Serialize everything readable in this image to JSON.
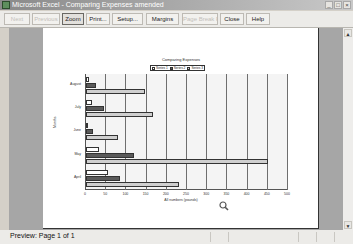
{
  "window": {
    "title": "Microsoft Excel - Comparing Expenses amended",
    "controls": [
      "minimize-icon",
      "restore-icon",
      "close-icon"
    ],
    "control_glyphs": [
      "_",
      "□",
      "×"
    ]
  },
  "toolbar": {
    "buttons": [
      {
        "label": "Next",
        "enabled": false,
        "pressed": false
      },
      {
        "label": "Previous",
        "enabled": false,
        "pressed": false
      },
      {
        "label": "Zoom",
        "enabled": true,
        "pressed": true
      },
      {
        "label": "Print...",
        "enabled": true,
        "pressed": false
      },
      {
        "label": "Setup...",
        "enabled": true,
        "pressed": false
      },
      {
        "label": "Margins",
        "enabled": true,
        "pressed": false
      },
      {
        "label": "Page Break Preview",
        "enabled": false,
        "pressed": false
      },
      {
        "label": "Close",
        "enabled": true,
        "pressed": false
      },
      {
        "label": "Help",
        "enabled": true,
        "pressed": false
      }
    ]
  },
  "status": {
    "text": "Preview: Page 1 of 1"
  },
  "scrollbar": {
    "up_glyph": "▲",
    "down_glyph": "▼"
  },
  "chart_data": {
    "type": "bar",
    "orientation": "horizontal",
    "title": "Comparing Expenses",
    "xlabel": "All numbers (pounds)",
    "ylabel": "Months",
    "categories": [
      "April",
      "May",
      "June",
      "July",
      "August"
    ],
    "series": [
      {
        "name": "Series 1",
        "color": "#ffffff",
        "values": [
          55,
          33,
          5,
          14,
          8
        ]
      },
      {
        "name": "Series 2",
        "color": "#5a5a5a",
        "values": [
          85,
          120,
          17,
          45,
          25
        ]
      },
      {
        "name": "Series 3",
        "color": "#cfcfcf",
        "values": [
          229,
          450,
          79,
          167,
          145
        ]
      }
    ],
    "xlim": [
      0,
      500
    ],
    "xticks": [
      "0",
      "50",
      "100",
      "150",
      "200",
      "250",
      "300",
      "350",
      "400",
      "450",
      "500"
    ],
    "grid": true,
    "legend_position": "top"
  }
}
